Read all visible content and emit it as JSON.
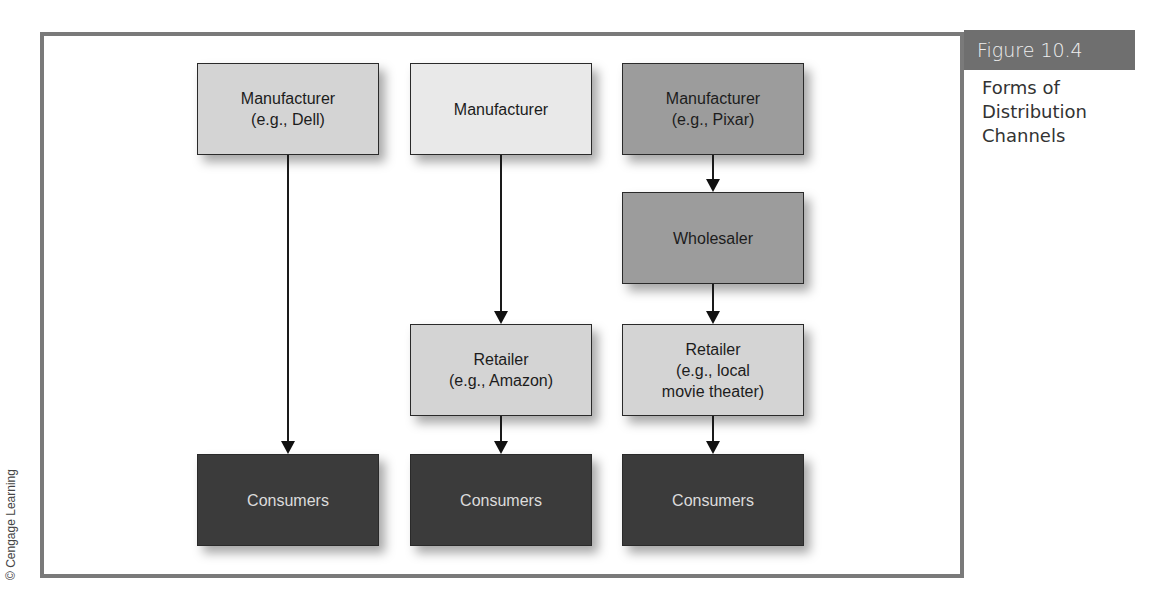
{
  "figure": {
    "number_label": "Figure 10.4",
    "caption": "Forms of Distribution Channels",
    "credit": "© Cengage Learning"
  },
  "channels": [
    {
      "nodes": [
        {
          "label": "Manufacturer\n(e.g., Dell)",
          "shade": "light"
        },
        {
          "label": "Consumers",
          "shade": "dark"
        }
      ]
    },
    {
      "nodes": [
        {
          "label": "Manufacturer",
          "shade": "lighter"
        },
        {
          "label": "Retailer\n(e.g., Amazon)",
          "shade": "light"
        },
        {
          "label": "Consumers",
          "shade": "dark"
        }
      ]
    },
    {
      "nodes": [
        {
          "label": "Manufacturer\n(e.g., Pixar)",
          "shade": "mid"
        },
        {
          "label": "Wholesaler",
          "shade": "mid"
        },
        {
          "label": "Retailer\n(e.g., local\nmovie theater)",
          "shade": "light"
        },
        {
          "label": "Consumers",
          "shade": "dark"
        }
      ]
    }
  ],
  "colors": {
    "frame": "#7a7a7a",
    "figure_bar": "#6f6f6f",
    "light": "#d4d4d4",
    "lighter": "#e9e9e9",
    "mid": "#9c9c9c",
    "dark": "#3b3b3b"
  }
}
